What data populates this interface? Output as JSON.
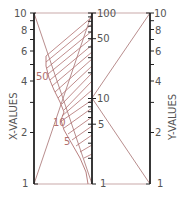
{
  "diagram": {
    "type": "nomograph",
    "axes": {
      "left": {
        "title": "X-VALUES",
        "scale": "log",
        "min": 1,
        "max": 10,
        "tick_labels": [
          "1",
          "2",
          "4",
          "6",
          "8",
          "10"
        ]
      },
      "middle": {
        "scale": "log",
        "min": 1,
        "max": 100,
        "tick_labels": [
          "1",
          "5",
          "10",
          "50",
          "100"
        ]
      },
      "right": {
        "title": "Y-VALUES",
        "scale": "log",
        "min": 1,
        "max": 10,
        "tick_labels": [
          "1",
          "2",
          "4",
          "6",
          "8",
          "10"
        ]
      }
    },
    "curve_labels": [
      "50",
      "10",
      "5"
    ],
    "colors": {
      "axis": "#222222",
      "guide_line": "#b08080",
      "hatch": "#b07070",
      "label_gray": "#555555",
      "label_red": "#b07070"
    }
  }
}
